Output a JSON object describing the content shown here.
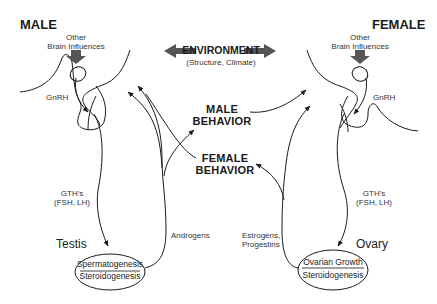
{
  "diagram": {
    "left_panel": {
      "title": "MALE",
      "brain_influence_label_line1": "Other",
      "brain_influence_label_line2": "Brain Influences",
      "gnrh_label": "GnRH",
      "gth_label_line1": "GTH's",
      "gth_label_line2": "(FSH, LH)",
      "gonad_label": "Testis",
      "gonad_function_top": "Spermatogenesis",
      "gonad_function_bottom": "Steroidogenesis",
      "hormone_label": "Androgens"
    },
    "right_panel": {
      "title": "FEMALE",
      "brain_influence_label_line1": "Other",
      "brain_influence_label_line2": "Brain Influences",
      "gnrh_label": "GnRH",
      "gth_label_line1": "GTH's",
      "gth_label_line2": "(FSH, LH)",
      "gonad_label": "Ovary",
      "gonad_function_top": "Ovarian Growth",
      "gonad_function_bottom": "Steroidogenesis",
      "hormone_label_line1": "Estrogens,",
      "hormone_label_line2": "Progestins"
    },
    "center": {
      "environment_label": "ENVIRONMENT",
      "environment_sublabel": "(Structure, Climate)",
      "male_behavior_line1": "MALE",
      "male_behavior_line2": "BEHAVIOR",
      "female_behavior_line1": "FEMALE",
      "female_behavior_line2": "BEHAVIOR"
    },
    "colors": {
      "line": "#1a1a1a",
      "block_arrow": "#555555",
      "text": "#1a1a1a"
    }
  }
}
